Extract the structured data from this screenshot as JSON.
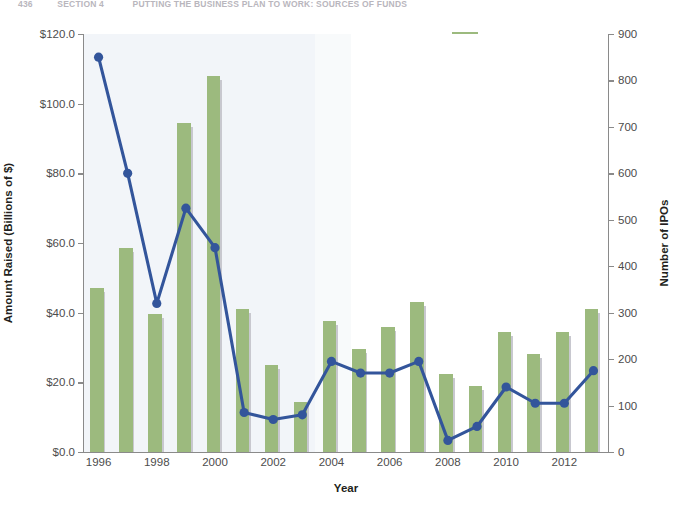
{
  "running_header": {
    "page_number": "436",
    "section": "SECTION 4",
    "title": "PUTTING THE BUSINESS PLAN TO WORK: SOURCES OF FUNDS"
  },
  "legend": {
    "position": "top-right",
    "items": [
      {
        "label": "$ Raised (Billions)",
        "marker": "bar-swatch",
        "color": "#9cba7e"
      },
      {
        "label": "Number",
        "marker": "line-marker",
        "color": "#33559b"
      }
    ]
  },
  "axes": {
    "x_title": "Year",
    "y_left_title": "Amount Raised (Billions of $)",
    "y_right_title": "Number of IPOs",
    "y_left_ticks": [
      "$0.0",
      "$20.0",
      "$40.0",
      "$60.0",
      "$80.0",
      "$100.0",
      "$120.0"
    ],
    "y_right_ticks": [
      "0",
      "100",
      "200",
      "300",
      "400",
      "500",
      "600",
      "700",
      "800",
      "900"
    ],
    "x_ticks": [
      "1996",
      "1998",
      "2000",
      "2002",
      "2004",
      "2006",
      "2008",
      "2010",
      "2012"
    ]
  },
  "colors": {
    "bar": "#9cba7e",
    "bar_shadow": "#c8c8cf",
    "line": "#33559b",
    "axis": "#8a8a8a",
    "text": "#231f20",
    "tint": "#eef2f7"
  },
  "chart_data": {
    "type": "bar",
    "title": "",
    "subtitle": "",
    "xlabel": "Year",
    "ylabel": "Amount Raised (Billions of $)",
    "y2label": "Number of IPOs",
    "ylim": [
      0,
      120
    ],
    "y2lim": [
      0,
      900
    ],
    "grid": false,
    "legend_position": "top-right",
    "categories": [
      "1996",
      "1997",
      "1998",
      "1999",
      "2000",
      "2001",
      "2002",
      "2003",
      "2004",
      "2005",
      "2006",
      "2007",
      "2008",
      "2009",
      "2010",
      "2011",
      "2012",
      "2013"
    ],
    "series": [
      {
        "name": "$ Raised (Billions)",
        "type": "bar",
        "axis": "left",
        "color": "#9cba7e",
        "values": [
          47.0,
          58.5,
          39.5,
          94.5,
          108.0,
          41.0,
          25.0,
          14.5,
          37.5,
          29.5,
          36.0,
          43.0,
          22.5,
          19.0,
          34.5,
          28.0,
          34.5,
          41.0
        ]
      },
      {
        "name": "Number",
        "type": "line",
        "axis": "right",
        "color": "#33559b",
        "values": [
          850,
          600,
          320,
          525,
          440,
          85,
          70,
          80,
          195,
          170,
          170,
          195,
          25,
          55,
          140,
          105,
          105,
          175
        ]
      }
    ]
  }
}
